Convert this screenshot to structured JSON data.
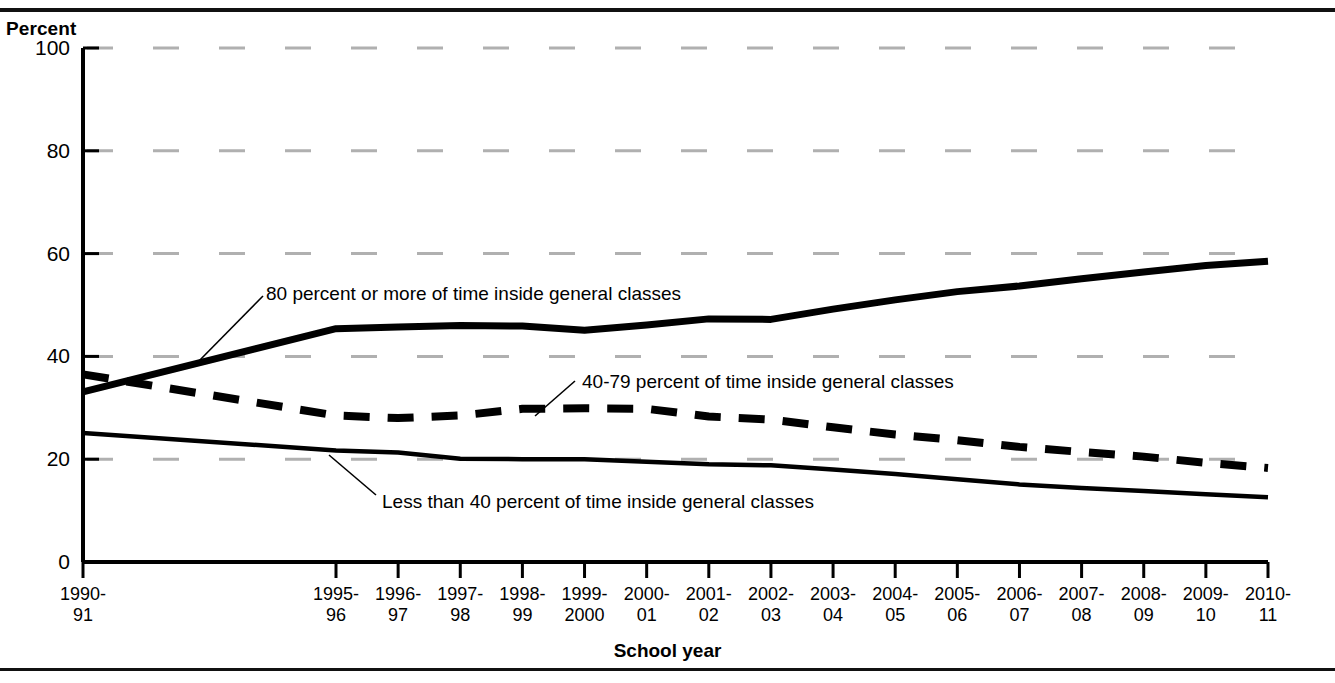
{
  "chart_data": {
    "type": "line",
    "title": "",
    "xlabel": "School year",
    "ylabel": "Percent",
    "ylim": [
      0,
      100
    ],
    "yticks": [
      0,
      20,
      40,
      60,
      80,
      100
    ],
    "grid": "horizontal dashed light-gray",
    "legend_position": "inline annotations with leader lines",
    "categories": [
      "1990-\n91",
      "1995-\n96",
      "1996-\n97",
      "1997-\n98",
      "1998-\n99",
      "1999-\n2000",
      "2000-\n01",
      "2001-\n02",
      "2002-\n03",
      "2003-\n04",
      "2004-\n05",
      "2005-\n06",
      "2006-\n07",
      "2007-\n08",
      "2008-\n09",
      "2009-\n10",
      "2010-\n11"
    ],
    "series": [
      {
        "name": "80 percent or more of time inside general classes",
        "style": "solid-thick",
        "values": [
          33.1,
          45.4,
          45.7,
          46.0,
          45.9,
          45.1,
          46.1,
          47.3,
          47.2,
          49.2,
          51.0,
          52.6,
          53.7,
          55.1,
          56.4,
          57.7,
          58.5
        ]
      },
      {
        "name": "40-79 percent of time inside general classes",
        "style": "dashed-thick",
        "values": [
          36.5,
          28.5,
          28.0,
          28.5,
          29.8,
          29.9,
          29.8,
          28.3,
          27.7,
          26.2,
          24.8,
          23.7,
          22.4,
          21.4,
          20.5,
          19.3,
          18.3
        ]
      },
      {
        "name": "Less than 40 percent of time inside general classes",
        "style": "solid-medium",
        "values": [
          25.1,
          21.7,
          21.3,
          20.1,
          20.0,
          20.0,
          19.5,
          19.0,
          18.8,
          18.0,
          17.1,
          16.1,
          15.1,
          14.4,
          13.8,
          13.2,
          12.6
        ]
      }
    ],
    "annotations": [
      {
        "text": "80 percent or more of time inside general classes",
        "leader_from_series": "80 percent or more of time inside general classes"
      },
      {
        "text": "40-79 percent of time inside general classes",
        "leader_from_series": "40-79 percent of time inside general classes"
      },
      {
        "text": "Less than 40 percent of time inside general classes",
        "leader_from_series": "Less than 40 percent of time inside general classes"
      }
    ],
    "colors": {
      "line": "#000000",
      "grid": "#b0b0b0",
      "axis": "#000000",
      "background": "#ffffff"
    }
  }
}
